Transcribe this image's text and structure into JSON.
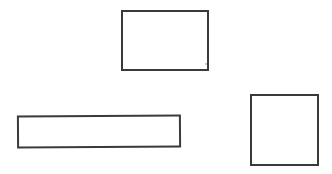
{
  "diagram": {
    "background": "#ffffff",
    "stroke_color": "#3a3a3a",
    "shapes": [
      {
        "id": "rect-top",
        "type": "rectangle",
        "x": 121,
        "y": 10,
        "width": 88,
        "height": 61,
        "stroke_width": 2,
        "rotate_deg": 0
      },
      {
        "id": "rect-wide",
        "type": "rectangle",
        "x": 17,
        "y": 115,
        "width": 164,
        "height": 33,
        "stroke_width": 2,
        "rotate_deg": -0.4
      },
      {
        "id": "rect-square",
        "type": "rectangle",
        "x": 250,
        "y": 94,
        "width": 69,
        "height": 72,
        "stroke_width": 2,
        "rotate_deg": 0
      }
    ],
    "specks": [
      {
        "x": 205,
        "y": 63
      }
    ]
  }
}
